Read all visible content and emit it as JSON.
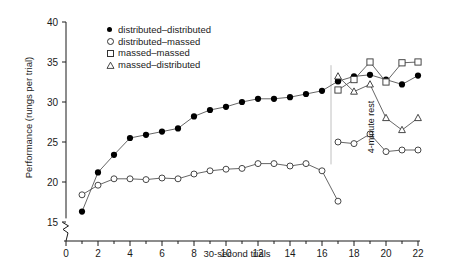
{
  "chart_data": {
    "type": "line",
    "title": "",
    "xlabel": "30-second trials",
    "ylabel": "Performance (rungs per trial)",
    "xlim": [
      0,
      22
    ],
    "ylim": [
      15,
      40
    ],
    "yticks": [
      15,
      20,
      25,
      30,
      35,
      40
    ],
    "xticks": [
      0,
      2,
      4,
      6,
      8,
      10,
      12,
      14,
      16,
      18,
      20,
      22
    ],
    "x_minor_tick_step": 1,
    "grid": false,
    "y_axis_break": true,
    "legend_position": "top-left-inside",
    "annotations": [
      {
        "text": "4-minute rest",
        "x": 17,
        "rotation": -90,
        "type": "vertical-divider-label"
      }
    ],
    "series": [
      {
        "name": "distributed–distributed",
        "marker": "filled-circle",
        "x": [
          1,
          2,
          3,
          4,
          5,
          6,
          7,
          8,
          9,
          10,
          11,
          12,
          13,
          14,
          15,
          16,
          17,
          17,
          18,
          19,
          20,
          21,
          22
        ],
        "values": [
          16.3,
          21.2,
          23.4,
          25.5,
          25.9,
          26.3,
          26.7,
          28.2,
          29.0,
          29.4,
          30.0,
          30.4,
          30.4,
          30.6,
          31.0,
          31.4,
          32.6,
          32.6,
          33.2,
          33.4,
          32.8,
          32.2,
          33.3
        ]
      },
      {
        "name": "distributed–massed",
        "marker": "open-circle",
        "x": [
          1,
          2,
          3,
          4,
          5,
          6,
          7,
          8,
          9,
          10,
          11,
          12,
          13,
          14,
          15,
          16,
          17,
          17,
          18,
          19,
          20,
          21,
          22
        ],
        "values": [
          18.4,
          19.6,
          20.4,
          20.4,
          20.3,
          20.5,
          20.4,
          21.0,
          21.4,
          21.6,
          21.7,
          22.3,
          22.3,
          22.0,
          22.3,
          21.4,
          17.6,
          25.0,
          24.8,
          26.0,
          23.8,
          24.0,
          24.0
        ]
      },
      {
        "name": "massed–massed",
        "marker": "open-square",
        "x": [
          17,
          18,
          19,
          20,
          21,
          22
        ],
        "values": [
          31.5,
          32.8,
          35.0,
          32.5,
          34.9,
          35.0
        ]
      },
      {
        "name": "massed–distributed",
        "marker": "open-triangle",
        "x": [
          17,
          18,
          19,
          20,
          21,
          22
        ],
        "values": [
          33.2,
          31.3,
          32.2,
          28.0,
          26.5,
          28.0
        ]
      }
    ]
  },
  "legend": {
    "items": [
      {
        "label": "distributed–distributed",
        "marker": "filled-circle"
      },
      {
        "label": "distributed–massed",
        "marker": "open-circle"
      },
      {
        "label": "massed–massed",
        "marker": "open-square"
      },
      {
        "label": "massed–distributed",
        "marker": "open-triangle"
      }
    ]
  },
  "annotation": {
    "rest_label": "4-minute rest"
  },
  "colors": {
    "ink": "#1a1a1a",
    "line": "#555555",
    "marker_fill": "#000000",
    "background": "#ffffff"
  }
}
